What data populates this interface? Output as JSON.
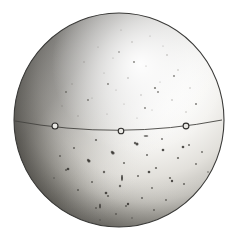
{
  "figure": {
    "title": "Sphere",
    "medium": "halftone photographic plate",
    "background_color": "#ffffff",
    "canvas": {
      "width": 239,
      "height": 237
    }
  },
  "sphere": {
    "name": "globe-disc",
    "center_x": 119,
    "center_y": 120,
    "radius_x": 105,
    "radius_y": 107,
    "outline_color": "#3a3a38",
    "outline_width": 1.1,
    "body_light_color": "#fbfbfa",
    "body_mid_color": "#d8d7d2",
    "body_shadow_color": "#4a4947",
    "terminator_color": "#6d6b66",
    "highlight_x_pct": 62,
    "highlight_y_pct": 26
  },
  "equator": {
    "name": "equator-line",
    "color": "#44433f",
    "width": 0.9,
    "left_x": 15,
    "left_y": 121,
    "mid_x": 121,
    "mid_y": 131,
    "right_x": 222,
    "right_y": 120,
    "markers": [
      {
        "id": "marker-west",
        "cx": 55,
        "cy": 126,
        "r": 3.0
      },
      {
        "id": "marker-central",
        "cx": 121,
        "cy": 131,
        "r": 2.8
      },
      {
        "id": "marker-east",
        "cx": 186,
        "cy": 126,
        "r": 2.9
      }
    ],
    "marker_ring_color": "#2e2d2b",
    "marker_fill_color": "#e9e8e4"
  },
  "speckles": {
    "name": "surface-speckles",
    "color_dark": "#52504b",
    "color_faint": "#9c9a95",
    "upper_count": 46,
    "lower_count": 78,
    "note": "scattered plate grain, denser below the equator"
  },
  "labels": {
    "alt_text": "Photographic plate of a sphere lit from the upper right, crossed by a thin equatorial line carrying three small ring markers."
  }
}
